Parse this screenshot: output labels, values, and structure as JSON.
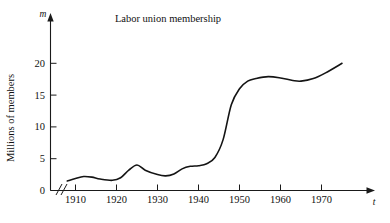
{
  "chart_data": {
    "type": "line",
    "title": "Labor union membership",
    "xlabel": "t",
    "ylabel": "Millions of members",
    "y_axis_variable": "m",
    "x_axis_variable": "t",
    "grid": false,
    "legend": "none",
    "axis_break": true,
    "axis_break_symbol": "//",
    "xlim": [
      1906,
      1978
    ],
    "ylim": [
      0,
      21.5
    ],
    "xticks": [
      1910,
      1920,
      1930,
      1940,
      1950,
      1960,
      1970
    ],
    "xtick_labels": [
      "1910",
      "1920",
      "1930",
      "1940",
      "1950",
      "1960",
      "1970"
    ],
    "yticks": [
      0,
      5,
      10,
      15,
      20
    ],
    "ytick_labels": [
      "0",
      "5",
      "10",
      "15",
      "20"
    ],
    "series": [
      {
        "name": "Labor union membership",
        "color": "#141414",
        "x": [
          1908,
          1910,
          1912,
          1914,
          1916,
          1919,
          1921,
          1923,
          1925,
          1927,
          1930,
          1932,
          1934,
          1936,
          1938,
          1940,
          1942,
          1944,
          1946,
          1948,
          1950,
          1952,
          1954,
          1957,
          1960,
          1963,
          1965,
          1968,
          1971,
          1975
        ],
        "y": [
          1.5,
          1.9,
          2.2,
          2.1,
          1.8,
          1.6,
          2.0,
          3.2,
          4.0,
          3.2,
          2.5,
          2.3,
          2.6,
          3.4,
          3.8,
          3.9,
          4.2,
          5.2,
          8.0,
          13.5,
          16.0,
          17.2,
          17.6,
          17.9,
          17.7,
          17.3,
          17.2,
          17.6,
          18.5,
          20.0
        ]
      }
    ],
    "annotations": []
  },
  "chart": {
    "title": "Labor union membership",
    "y_axis_label": "Millions of members",
    "y_axis_variable": "m",
    "x_axis_variable": "t",
    "y_tick_0": "0",
    "y_tick_5": "5",
    "y_tick_10": "10",
    "y_tick_15": "15",
    "y_tick_20": "20",
    "x_tick_1910": "1910",
    "x_tick_1920": "1920",
    "x_tick_1930": "1930",
    "x_tick_1940": "1940",
    "x_tick_1950": "1950",
    "x_tick_1960": "1960",
    "x_tick_1970": "1970"
  }
}
